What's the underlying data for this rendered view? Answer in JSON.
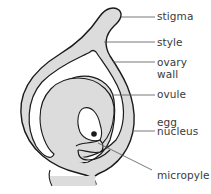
{
  "diagram": {
    "colors": {
      "fill": "#dcdcdc",
      "stroke": "#1a1a1a",
      "leader": "#555555",
      "background": "#ffffff",
      "text": "#3a3a3a"
    },
    "labels": [
      {
        "id": "stigma",
        "text": "stigma",
        "x": 157,
        "y": 11
      },
      {
        "id": "style",
        "text": "style",
        "x": 157,
        "y": 37
      },
      {
        "id": "ovary-wall-1",
        "text": "ovary",
        "x": 157,
        "y": 57
      },
      {
        "id": "ovary-wall-2",
        "text": "wall",
        "x": 157,
        "y": 69
      },
      {
        "id": "ovule",
        "text": "ovule",
        "x": 157,
        "y": 89
      },
      {
        "id": "egg-1",
        "text": "egg",
        "x": 157,
        "y": 117
      },
      {
        "id": "egg-2",
        "text": "nucleus",
        "x": 157,
        "y": 126
      },
      {
        "id": "micropyle",
        "text": "micropyle",
        "x": 157,
        "y": 170
      }
    ]
  }
}
